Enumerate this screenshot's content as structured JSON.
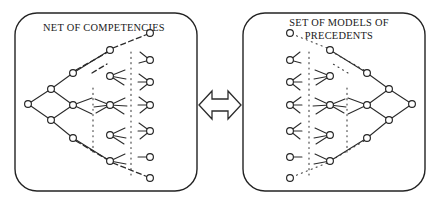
{
  "figure": {
    "kind": "concept-diagram",
    "background_color": "#ffffff",
    "stroke_color": "#232323",
    "width": 437,
    "height": 208
  },
  "left_panel": {
    "name": "net-of-competencies",
    "title": "NET OF COMPETENCIES",
    "title_lines": [
      "NET OF COMPETENCIES"
    ],
    "frame": {
      "x": 15,
      "y": 13,
      "width": 182,
      "height": 178,
      "radius": 22
    },
    "title_anchor": {
      "x": 104,
      "y": 28
    },
    "root_side": "left",
    "nodes": [
      {
        "id": "L0",
        "x": 28,
        "y": 104,
        "r": 3.4
      },
      {
        "id": "L1a",
        "x": 51,
        "y": 89,
        "r": 3.4
      },
      {
        "id": "L1b",
        "x": 51,
        "y": 120,
        "r": 3.4
      },
      {
        "id": "L2a",
        "x": 73,
        "y": 73,
        "r": 3.4
      },
      {
        "id": "L2b",
        "x": 73,
        "y": 105,
        "r": 3.4
      },
      {
        "id": "L2c",
        "x": 73,
        "y": 138,
        "r": 3.4
      },
      {
        "id": "L3a",
        "x": 110,
        "y": 50,
        "r": 3.4
      },
      {
        "id": "L3b",
        "x": 110,
        "y": 76,
        "r": 3.4
      },
      {
        "id": "L3c",
        "x": 110,
        "y": 105,
        "r": 3.4
      },
      {
        "id": "L3d",
        "x": 110,
        "y": 135,
        "r": 3.4
      },
      {
        "id": "L3e",
        "x": 110,
        "y": 161,
        "r": 3.4
      },
      {
        "id": "L4a",
        "x": 150,
        "y": 33,
        "r": 3.4
      },
      {
        "id": "L4b",
        "x": 150,
        "y": 60,
        "r": 3.4
      },
      {
        "id": "L4c",
        "x": 150,
        "y": 82,
        "r": 3.4
      },
      {
        "id": "L4d",
        "x": 150,
        "y": 105,
        "r": 3.4
      },
      {
        "id": "L4e",
        "x": 150,
        "y": 131,
        "r": 3.4
      },
      {
        "id": "L4f",
        "x": 150,
        "y": 157,
        "r": 3.4
      },
      {
        "id": "L4g",
        "x": 150,
        "y": 178,
        "r": 3.4
      }
    ],
    "edge_count": 34,
    "leaf_fan_count": 9
  },
  "right_panel": {
    "name": "set-of-models-of-precedents",
    "title": "SET OF MODELS OF PRECEDENTS",
    "title_lines": [
      "SET OF MODELS OF",
      "PRECEDENTS"
    ],
    "frame": {
      "x": 243,
      "y": 13,
      "width": 182,
      "height": 178,
      "radius": 22
    },
    "title_anchor": {
      "x": 339,
      "y": 27
    },
    "root_side": "right",
    "nodes": [
      {
        "id": "R0",
        "x": 412,
        "y": 104,
        "r": 3.4
      },
      {
        "id": "R1a",
        "x": 389,
        "y": 89,
        "r": 3.4
      },
      {
        "id": "R1b",
        "x": 389,
        "y": 120,
        "r": 3.4
      },
      {
        "id": "R2a",
        "x": 367,
        "y": 73,
        "r": 3.4
      },
      {
        "id": "R2b",
        "x": 367,
        "y": 105,
        "r": 3.4
      },
      {
        "id": "R2c",
        "x": 367,
        "y": 138,
        "r": 3.4
      },
      {
        "id": "R3a",
        "x": 330,
        "y": 50,
        "r": 3.4
      },
      {
        "id": "R3b",
        "x": 330,
        "y": 76,
        "r": 3.4
      },
      {
        "id": "R3c",
        "x": 330,
        "y": 105,
        "r": 3.4
      },
      {
        "id": "R3d",
        "x": 330,
        "y": 135,
        "r": 3.4
      },
      {
        "id": "R3e",
        "x": 330,
        "y": 161,
        "r": 3.4
      },
      {
        "id": "R4a",
        "x": 290,
        "y": 33,
        "r": 3.4
      },
      {
        "id": "R4b",
        "x": 290,
        "y": 60,
        "r": 3.4
      },
      {
        "id": "R4c",
        "x": 290,
        "y": 82,
        "r": 3.4
      },
      {
        "id": "R4d",
        "x": 290,
        "y": 105,
        "r": 3.4
      },
      {
        "id": "R4e",
        "x": 290,
        "y": 131,
        "r": 3.4
      },
      {
        "id": "R4f",
        "x": 290,
        "y": 157,
        "r": 3.4
      },
      {
        "id": "R4g",
        "x": 290,
        "y": 178,
        "r": 3.4
      }
    ],
    "edge_count": 34,
    "leaf_fan_count": 9
  },
  "connector": {
    "name": "bidirectional-arrow",
    "style": "double-headed-block-arrow",
    "orientation": "horizontal",
    "x": 199,
    "y": 90,
    "width": 42,
    "height": 30,
    "fill": "#ffffff",
    "stroke": "#2b2b2b",
    "label": ""
  },
  "legend": {
    "edge_styles": [
      "solid",
      "dashed",
      "dotted"
    ]
  }
}
